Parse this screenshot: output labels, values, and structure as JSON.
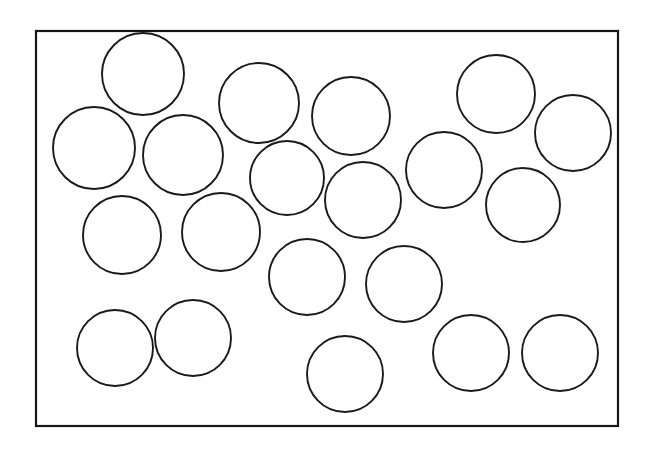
{
  "figure": {
    "background_color": "#ffffff",
    "stroke_color": "#151515",
    "fill_color": "#ffffff",
    "canvas": {
      "width": 650,
      "height": 451
    }
  },
  "frame": {
    "name": "bounding-rectangle",
    "x": 36,
    "y": 31,
    "width": 582,
    "height": 395,
    "stroke_width": 2.2,
    "stroke_color": "#151515",
    "fill_color": "#ffffff"
  },
  "counts": {
    "circle_count": 20
  },
  "chart_data": {
    "type": "scatter",
    "subtitle": "",
    "xlabel": "",
    "ylabel": "",
    "grid": false,
    "legend": "none",
    "xlim": [
      36,
      618
    ],
    "ylim": [
      31,
      426
    ],
    "units": "pixels",
    "marker": "open-circle",
    "stroke_color": "#1a1a1a",
    "fill_color": "#ffffff",
    "stroke_width": 1.9,
    "series": [
      {
        "name": "packed-circles",
        "circles": [
          {
            "id": 1,
            "label": "circle-1",
            "cx": 143,
            "cy": 74,
            "r": 41
          },
          {
            "id": 2,
            "label": "circle-2",
            "cx": 94,
            "cy": 148,
            "r": 41
          },
          {
            "id": 3,
            "label": "circle-3",
            "cx": 183,
            "cy": 155,
            "r": 40
          },
          {
            "id": 4,
            "label": "circle-4",
            "cx": 259,
            "cy": 103,
            "r": 40
          },
          {
            "id": 5,
            "label": "circle-5",
            "cx": 351,
            "cy": 116,
            "r": 39
          },
          {
            "id": 6,
            "label": "circle-6",
            "cx": 496,
            "cy": 94,
            "r": 39
          },
          {
            "id": 7,
            "label": "circle-7",
            "cx": 573,
            "cy": 133,
            "r": 38
          },
          {
            "id": 8,
            "label": "circle-8",
            "cx": 444,
            "cy": 170,
            "r": 38
          },
          {
            "id": 9,
            "label": "circle-9",
            "cx": 523,
            "cy": 205,
            "r": 37
          },
          {
            "id": 10,
            "label": "circle-10",
            "cx": 287,
            "cy": 178,
            "r": 37
          },
          {
            "id": 11,
            "label": "circle-11",
            "cx": 363,
            "cy": 200,
            "r": 38
          },
          {
            "id": 12,
            "label": "circle-12",
            "cx": 122,
            "cy": 235,
            "r": 39
          },
          {
            "id": 13,
            "label": "circle-13",
            "cx": 221,
            "cy": 232,
            "r": 39
          },
          {
            "id": 14,
            "label": "circle-14",
            "cx": 307,
            "cy": 277,
            "r": 38
          },
          {
            "id": 15,
            "label": "circle-15",
            "cx": 404,
            "cy": 284,
            "r": 38
          },
          {
            "id": 16,
            "label": "circle-16",
            "cx": 115,
            "cy": 348,
            "r": 38
          },
          {
            "id": 17,
            "label": "circle-17",
            "cx": 193,
            "cy": 338,
            "r": 38
          },
          {
            "id": 18,
            "label": "circle-18",
            "cx": 345,
            "cy": 374,
            "r": 38
          },
          {
            "id": 19,
            "label": "circle-19",
            "cx": 471,
            "cy": 353,
            "r": 38
          },
          {
            "id": 20,
            "label": "circle-20",
            "cx": 560,
            "cy": 353,
            "r": 38
          }
        ]
      }
    ]
  }
}
